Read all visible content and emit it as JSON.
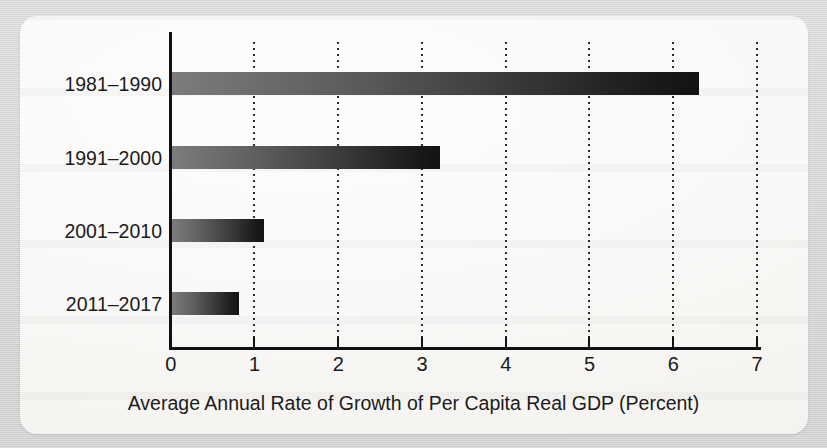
{
  "figure": {
    "background_color": "#d6d6d6",
    "card_color": "#fbfaf8",
    "bar_gradient_start": "#7c7c7c",
    "bar_gradient_end": "#131313",
    "axis_color": "#111111",
    "gridline_color": "#2a2a2a"
  },
  "chart_data": {
    "type": "bar",
    "orientation": "horizontal",
    "title": "",
    "xlabel": "Average Annual Rate of Growth of Per Capita Real GDP (Percent)",
    "ylabel": "",
    "categories": [
      "1981–1990",
      "1991–2000",
      "2001–2010",
      "2011–2017"
    ],
    "values": [
      6.3,
      3.2,
      1.1,
      0.8
    ],
    "xlim": [
      0,
      7
    ],
    "xticks": [
      0,
      1,
      2,
      3,
      4,
      5,
      6,
      7
    ],
    "xtick_labels": [
      "0",
      "1",
      "2",
      "3",
      "4",
      "5",
      "6",
      "7"
    ],
    "grid": "vertical-dotted",
    "legend": "none",
    "series": [
      {
        "name": "Average Annual Rate of Growth of Per Capita Real GDP",
        "values": [
          6.3,
          3.2,
          1.1,
          0.8
        ]
      }
    ]
  }
}
